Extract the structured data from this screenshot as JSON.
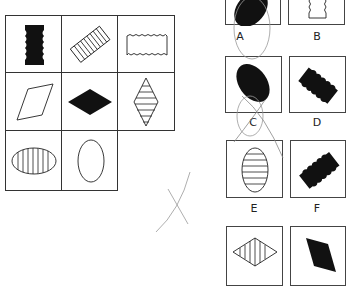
{
  "puzzle": {
    "matrix": {
      "rows": 3,
      "cols": 3,
      "cells": [
        {
          "row": 0,
          "col": 0,
          "shape": "wavy-rectangle-vertical",
          "fill": "black"
        },
        {
          "row": 0,
          "col": 1,
          "shape": "wavy-rectangle-diagonal",
          "fill": "striped"
        },
        {
          "row": 0,
          "col": 2,
          "shape": "wavy-rectangle-horizontal",
          "fill": "white"
        },
        {
          "row": 1,
          "col": 0,
          "shape": "parallelogram-tilted",
          "fill": "white"
        },
        {
          "row": 1,
          "col": 1,
          "shape": "diamond-horizontal",
          "fill": "black"
        },
        {
          "row": 1,
          "col": 2,
          "shape": "diamond-vertical",
          "fill": "striped"
        },
        {
          "row": 2,
          "col": 0,
          "shape": "ellipse-horizontal",
          "fill": "striped"
        },
        {
          "row": 2,
          "col": 1,
          "shape": "ellipse-vertical",
          "fill": "white"
        },
        {
          "row": 2,
          "col": 2,
          "shape": "missing",
          "fill": "none"
        }
      ]
    },
    "options": [
      {
        "label": "A",
        "shape": "ellipse-tilted",
        "fill": "black"
      },
      {
        "label": "B",
        "shape": "wavy-rectangle-vertical",
        "fill": "white"
      },
      {
        "label": "C",
        "shape": "ellipse-tilted",
        "fill": "black"
      },
      {
        "label": "D",
        "shape": "wavy-rectangle-diagonal",
        "fill": "black"
      },
      {
        "label": "E",
        "shape": "ellipse-vertical",
        "fill": "striped"
      },
      {
        "label": "F",
        "shape": "wavy-rectangle-diagonal",
        "fill": "black"
      },
      {
        "label": "G",
        "shape": "diamond-horizontal",
        "fill": "striped"
      },
      {
        "label": "H",
        "shape": "parallelogram-tilted",
        "fill": "black"
      }
    ],
    "annotations": [
      "pencil-circle-A",
      "pencil-circle-cross-C",
      "pencil-cross-mark"
    ]
  }
}
